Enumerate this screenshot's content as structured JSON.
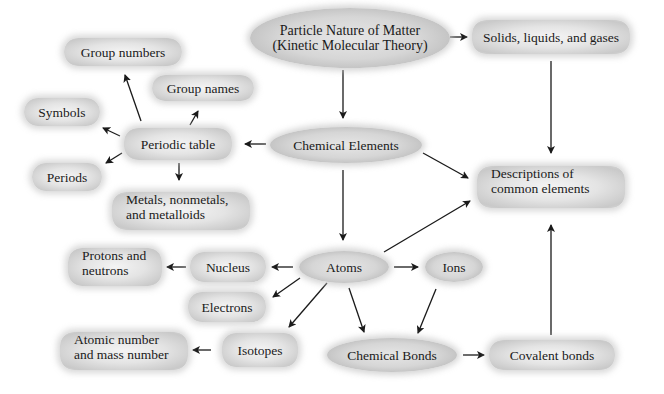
{
  "diagram": {
    "type": "concept-map",
    "nodes": {
      "particle_nature": {
        "line1": "Particle Nature of Matter",
        "line2": "(Kinetic Molecular Theory)"
      },
      "solids": {
        "label": "Solids, liquids, and gases"
      },
      "chemical_elements": {
        "label": "Chemical Elements"
      },
      "descriptions": {
        "line1": "Descriptions of",
        "line2": "common elements"
      },
      "periodic_table": {
        "label": "Periodic table"
      },
      "group_numbers": {
        "label": "Group numbers"
      },
      "group_names": {
        "label": "Group names"
      },
      "symbols": {
        "label": "Symbols"
      },
      "periods": {
        "label": "Periods"
      },
      "metals": {
        "line1": "Metals, nonmetals,",
        "line2": "and metalloids"
      },
      "atoms": {
        "label": "Atoms"
      },
      "ions": {
        "label": "Ions"
      },
      "nucleus": {
        "label": "Nucleus"
      },
      "protons": {
        "line1": "Protons and",
        "line2": "neutrons"
      },
      "electrons": {
        "label": "Electrons"
      },
      "isotopes": {
        "label": "Isotopes"
      },
      "atomic_number": {
        "line1": "Atomic number",
        "line2": "and mass number"
      },
      "chemical_bonds": {
        "label": "Chemical Bonds"
      },
      "covalent_bonds": {
        "label": "Covalent bonds"
      }
    },
    "edges": [
      [
        "Particle Nature of Matter",
        "Solids, liquids, and gases"
      ],
      [
        "Particle Nature of Matter",
        "Chemical Elements"
      ],
      [
        "Solids, liquids, and gases",
        "Descriptions of common elements"
      ],
      [
        "Chemical Elements",
        "Periodic table"
      ],
      [
        "Chemical Elements",
        "Descriptions of common elements"
      ],
      [
        "Chemical Elements",
        "Atoms"
      ],
      [
        "Periodic table",
        "Group numbers"
      ],
      [
        "Periodic table",
        "Group names"
      ],
      [
        "Periodic table",
        "Symbols"
      ],
      [
        "Periodic table",
        "Periods"
      ],
      [
        "Periodic table",
        "Metals, nonmetals, and metalloids"
      ],
      [
        "Atoms",
        "Descriptions of common elements"
      ],
      [
        "Atoms",
        "Nucleus"
      ],
      [
        "Atoms",
        "Ions"
      ],
      [
        "Atoms",
        "Electrons"
      ],
      [
        "Atoms",
        "Isotopes"
      ],
      [
        "Atoms",
        "Chemical Bonds"
      ],
      [
        "Nucleus",
        "Protons and neutrons"
      ],
      [
        "Isotopes",
        "Atomic number and mass number"
      ],
      [
        "Ions",
        "Chemical Bonds"
      ],
      [
        "Chemical Bonds",
        "Covalent bonds"
      ],
      [
        "Covalent bonds",
        "Descriptions of common elements"
      ]
    ]
  }
}
